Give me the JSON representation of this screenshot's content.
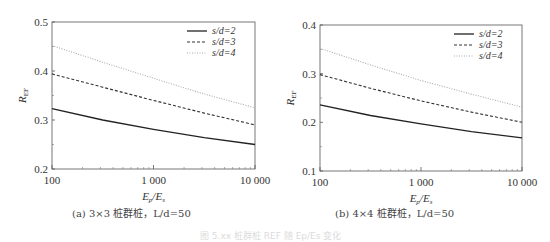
{
  "chart_data": [
    {
      "type": "line",
      "panel": "a",
      "caption": "(a) 3×3 桩群桩，L/d=50",
      "xlabel": "Ep/Es",
      "ylabel": "R_EF",
      "xscale": "log",
      "xlim": [
        100,
        10000
      ],
      "ylim": [
        0.2,
        0.5
      ],
      "xticks": [
        "100",
        "1 000",
        "10 000"
      ],
      "yticks": [
        "0.2",
        "0.3",
        "0.4",
        "0.5"
      ],
      "legend_position": "upper right",
      "x": [
        100,
        316,
        1000,
        3162,
        10000
      ],
      "series": [
        {
          "name": "s/d=2",
          "style": "solid",
          "values": [
            0.323,
            0.3,
            0.281,
            0.264,
            0.25
          ]
        },
        {
          "name": "s/d=3",
          "style": "dashed",
          "values": [
            0.394,
            0.367,
            0.34,
            0.314,
            0.29
          ]
        },
        {
          "name": "s/d=4",
          "style": "dotted",
          "values": [
            0.452,
            0.418,
            0.385,
            0.353,
            0.325
          ]
        }
      ]
    },
    {
      "type": "line",
      "panel": "b",
      "caption": "(b) 4×4 桩群桩，L/d=50",
      "xlabel": "Ep/Es",
      "ylabel": "R_EF",
      "xscale": "log",
      "xlim": [
        100,
        10000
      ],
      "ylim": [
        0.1,
        0.4
      ],
      "xticks": [
        "100",
        "1 000",
        "10 000"
      ],
      "yticks": [
        "0.1",
        "0.2",
        "0.3",
        "0.4"
      ],
      "legend_position": "upper right",
      "x": [
        100,
        316,
        1000,
        3162,
        10000
      ],
      "series": [
        {
          "name": "s/d=2",
          "style": "solid",
          "values": [
            0.236,
            0.214,
            0.197,
            0.181,
            0.168
          ]
        },
        {
          "name": "s/d=3",
          "style": "dashed",
          "values": [
            0.298,
            0.27,
            0.244,
            0.221,
            0.2
          ]
        },
        {
          "name": "s/d=4",
          "style": "dotted",
          "values": [
            0.352,
            0.318,
            0.286,
            0.258,
            0.231
          ]
        }
      ]
    }
  ],
  "panels": {
    "a": {
      "caption": "(a) 3×3 桩群桩，L/d=50"
    },
    "b": {
      "caption": "(b) 4×4 桩群桩，L/d=50"
    }
  },
  "figure_caption": "图 5.xx 桩群桩 REF 随 Ep/Es 变化"
}
